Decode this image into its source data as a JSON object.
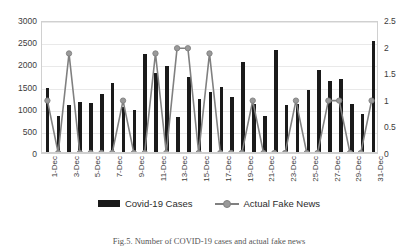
{
  "chart_data": {
    "type": "bar",
    "title": "",
    "xlabel": "",
    "ylabel": "",
    "grid": true,
    "legend_position": "bottom",
    "categories": [
      "1-Dec",
      "2-Dec",
      "3-Dec",
      "4-Dec",
      "5-Dec",
      "6-Dec",
      "7-Dec",
      "8-Dec",
      "9-Dec",
      "10-Dec",
      "11-Dec",
      "12-Dec",
      "13-Dec",
      "14-Dec",
      "15-Dec",
      "16-Dec",
      "17-Dec",
      "18-Dec",
      "19-Dec",
      "20-Dec",
      "21-Dec",
      "22-Dec",
      "23-Dec",
      "24-Dec",
      "25-Dec",
      "26-Dec",
      "27-Dec",
      "28-Dec",
      "29-Dec",
      "30-Dec",
      "31-Dec"
    ],
    "tick_labels_x": [
      "1-Dec",
      "3-Dec",
      "5-Dec",
      "7-Dec",
      "9-Dec",
      "11-Dec",
      "13-Dec",
      "15-Dec",
      "17-Dec",
      "19-Dec",
      "21-Dec",
      "23-Dec",
      "25-Dec",
      "27-Dec",
      "29-Dec",
      "31-Dec"
    ],
    "series": [
      {
        "name": "Covid-19 Cases",
        "type": "bar",
        "axis": "left",
        "color": "#1a1a1a",
        "values": [
          1470,
          830,
          1080,
          1140,
          1120,
          1340,
          1590,
          1030,
          960,
          2240,
          1800,
          1960,
          820,
          1720,
          1220,
          1380,
          1500,
          1260,
          2060,
          1100,
          830,
          2320,
          1080,
          1100,
          1420,
          1880,
          1620,
          1660,
          1100,
          880,
          2520
        ]
      },
      {
        "name": "Actual Fake News",
        "type": "line",
        "axis": "right",
        "color": "#808080",
        "marker": "circle",
        "marker_color": "#9a9a9a",
        "values": [
          1,
          0,
          1.9,
          0,
          0,
          0,
          0,
          1,
          0,
          0,
          1.9,
          0,
          2,
          2,
          0,
          1.9,
          0,
          0,
          0,
          1,
          0,
          0,
          0,
          1,
          0,
          0,
          1,
          1,
          0,
          0,
          1
        ]
      }
    ],
    "y_left": {
      "min": 0,
      "max": 3000,
      "ticks": [
        0,
        500,
        1000,
        1500,
        2000,
        2500,
        3000
      ],
      "tick_labels": [
        "0",
        "500",
        "1000",
        "1500",
        "2000",
        "2500",
        "3000"
      ]
    },
    "y_right": {
      "min": 0,
      "max": 2.5,
      "ticks": [
        0,
        0.5,
        1,
        1.5,
        2,
        2.5
      ],
      "tick_labels": [
        "0",
        "0.5",
        "1",
        "1.5",
        "2",
        "2.5"
      ]
    }
  },
  "legend": {
    "items": [
      {
        "label": "Covid-19 Cases",
        "marker": "bar-swatch",
        "color": "#1a1a1a"
      },
      {
        "label": "Actual Fake News",
        "marker": "line-marker-swatch",
        "color": "#808080"
      }
    ]
  },
  "caption": {
    "text": "Fig.5. Number of COVID-19 cases and actual fake news"
  }
}
